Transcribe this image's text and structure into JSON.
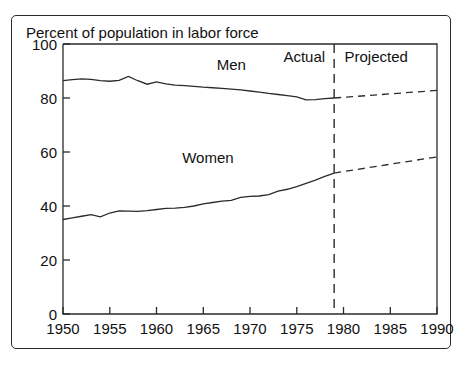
{
  "chart_data": {
    "type": "line",
    "title": "Percent of population in labor force",
    "xlabel": "",
    "ylabel": "",
    "xlim": [
      1950,
      1990
    ],
    "ylim": [
      0,
      100
    ],
    "xticks": [
      1950,
      1955,
      1960,
      1965,
      1970,
      1975,
      1980,
      1985,
      1990
    ],
    "xtick_labels": [
      "1950",
      "1955",
      "1960",
      "1965",
      "1970",
      "1975",
      "1980",
      "1985",
      "1990"
    ],
    "yticks": [
      0,
      20,
      40,
      60,
      80,
      100
    ],
    "ytick_labels": [
      "0",
      "20",
      "40",
      "60",
      "80",
      "100"
    ],
    "grid": false,
    "legend_position": "inline-annotations",
    "annotations": [
      {
        "name": "men-series-label",
        "text": "Men",
        "x": 1968.0,
        "y": 90.5
      },
      {
        "name": "women-series-label",
        "text": "Women",
        "x": 1965.5,
        "y": 56.0
      },
      {
        "name": "actual-region-label",
        "text": "Actual",
        "x": 1975.8,
        "y": 93.5
      },
      {
        "name": "projected-region-label",
        "text": "Projected",
        "x": 1983.5,
        "y": 93.5
      }
    ],
    "divider": {
      "name": "actual-projected-divider",
      "x": 1979,
      "style": "dashed-vertical",
      "label_left": "Actual",
      "label_right": "Projected"
    },
    "series": [
      {
        "name": "Men",
        "style": "solid",
        "x": [
          1950,
          1951,
          1952,
          1953,
          1954,
          1955,
          1956,
          1957,
          1958,
          1959,
          1960,
          1961,
          1962,
          1963,
          1964,
          1965,
          1966,
          1967,
          1968,
          1969,
          1970,
          1971,
          1972,
          1973,
          1974,
          1975,
          1976,
          1977,
          1978,
          1979
        ],
        "values": [
          86.4,
          86.8,
          87.1,
          86.9,
          86.4,
          86.2,
          86.5,
          88.0,
          86.4,
          85.1,
          86.0,
          85.2,
          84.8,
          84.6,
          84.3,
          84.0,
          83.8,
          83.6,
          83.3,
          83.0,
          82.6,
          82.2,
          81.7,
          81.3,
          80.9,
          80.4,
          79.3,
          79.4,
          79.8,
          80.0
        ],
        "projected_x": [
          1979,
          1990
        ],
        "projected_values": [
          80.0,
          82.8
        ],
        "projected_style": "dashed"
      },
      {
        "name": "Women",
        "style": "solid",
        "x": [
          1950,
          1951,
          1952,
          1953,
          1954,
          1955,
          1956,
          1957,
          1958,
          1959,
          1960,
          1961,
          1962,
          1963,
          1964,
          1965,
          1966,
          1967,
          1968,
          1969,
          1970,
          1971,
          1972,
          1973,
          1974,
          1975,
          1976,
          1977,
          1978,
          1979
        ],
        "values": [
          35.0,
          35.6,
          36.2,
          36.8,
          36.0,
          37.4,
          38.2,
          38.1,
          38.0,
          38.3,
          38.7,
          39.1,
          39.2,
          39.5,
          40.0,
          40.8,
          41.3,
          41.8,
          42.1,
          43.2,
          43.6,
          43.7,
          44.2,
          45.5,
          46.2,
          47.2,
          48.4,
          49.6,
          51.0,
          52.2
        ],
        "projected_x": [
          1979,
          1990
        ],
        "projected_values": [
          52.2,
          58.2
        ],
        "projected_style": "dashed"
      }
    ]
  },
  "figure": {
    "title": "Percent of population in labor force"
  }
}
